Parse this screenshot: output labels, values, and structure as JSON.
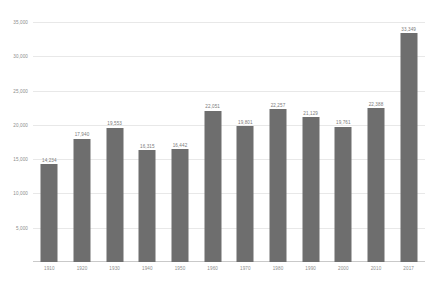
{
  "chart_data": {
    "type": "bar",
    "title": "",
    "subtitle": "",
    "xlabel": "",
    "ylabel": "",
    "categories": [
      "1910",
      "1920",
      "1930",
      "1940",
      "1950",
      "1960",
      "1970",
      "1980",
      "1990",
      "2000",
      "2010",
      "2017"
    ],
    "values": [
      14234,
      17940,
      19553,
      16315,
      16442,
      22051,
      19801,
      22257,
      21129,
      19761,
      22388,
      33349
    ],
    "data_labels": [
      "14,234",
      "17,940",
      "19,553",
      "16,315",
      "16,442",
      "22,051",
      "19,801",
      "22,257",
      "21,129",
      "19,761",
      "22,388",
      "33,349"
    ],
    "ylim": [
      0,
      35000
    ],
    "ytick_values": [
      0,
      5000,
      10000,
      15000,
      20000,
      25000,
      30000,
      35000
    ],
    "ytick_labels": [
      "0",
      "5,000",
      "10,000",
      "15,000",
      "20,000",
      "25,000",
      "30,000",
      "35,000"
    ],
    "grid": true,
    "legend": false,
    "legend_position": "none",
    "bar_color": "#6e6e6e",
    "grid_color": "#e8e8e8",
    "axis_color": "#c9c9c9",
    "label_color": "#8c8c8c"
  }
}
